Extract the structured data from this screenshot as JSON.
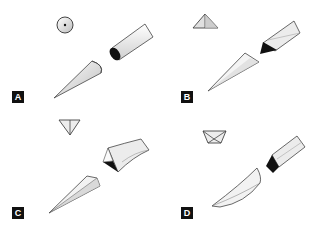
{
  "figure": {
    "panels": [
      {
        "id": "A",
        "label": "A",
        "cross_section": "circle-with-center-dot",
        "tip_shape": "conical-round",
        "shaft_end": "circular-dark-face"
      },
      {
        "id": "B",
        "label": "B",
        "cross_section": "upward-triangle-with-vertical-line",
        "tip_shape": "triangular-cutting",
        "shaft_end": "triangular-dark-face"
      },
      {
        "id": "C",
        "label": "C",
        "cross_section": "downward-triangle-with-vertical-line",
        "tip_shape": "reverse-cutting",
        "shaft_end": "inverted-triangular-dark-face"
      },
      {
        "id": "D",
        "label": "D",
        "cross_section": "trapezoid-with-inner-v",
        "tip_shape": "spatula-curved",
        "shaft_end": "trapezoidal-dark-face"
      }
    ],
    "colors": {
      "outline": "#333333",
      "fill_light": "#f2f2f2",
      "fill_mid": "#cfcfcf",
      "fill_dark": "#111111",
      "label_bg": "#111111",
      "label_text": "#ffffff"
    }
  }
}
